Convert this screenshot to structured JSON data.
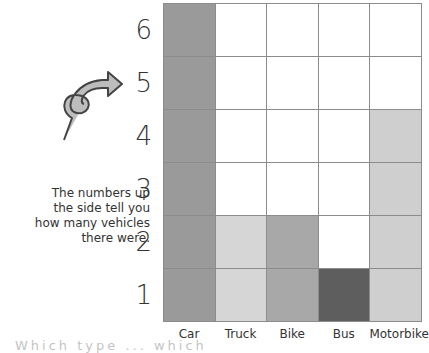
{
  "chart_data": {
    "type": "bar",
    "style": "pictogram-block-chart",
    "categories": [
      "Car",
      "Truck",
      "Bike",
      "Bus",
      "Motorbike"
    ],
    "values": [
      6,
      2,
      2,
      1,
      4
    ],
    "colors": [
      "#9a9a9a",
      "#d6d6d6",
      "#a8a8a8",
      "#5e5e5e",
      "#cfcfcf"
    ],
    "yticks": [
      "1",
      "2",
      "3",
      "4",
      "5",
      "6"
    ],
    "ylim": [
      0,
      6
    ],
    "grid": true,
    "annotation": "The numbers up the side tell you how many vehicles there were."
  },
  "note_lines": [
    "The numbers up",
    "the side tell you",
    "how many vehicles",
    "there were."
  ],
  "cut_text": "Which type ... which"
}
